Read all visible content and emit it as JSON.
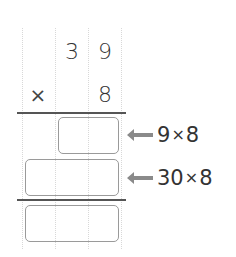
{
  "problem": {
    "multiplicand": {
      "tens": "3",
      "ones": "9"
    },
    "operator": "×",
    "multiplier": {
      "ones": "8"
    }
  },
  "partial_products": [
    {
      "label_left": "9",
      "label_op": "×",
      "label_right": "8",
      "value": ""
    },
    {
      "label_left": "30",
      "label_op": "×",
      "label_right": "8",
      "value": ""
    }
  ],
  "total": {
    "value": ""
  },
  "colors": {
    "gridline": "#d8d8d8",
    "rule": "#555555",
    "box_border": "#9a9a9a",
    "arrow": "#8a8a8a",
    "text": "#333333"
  }
}
